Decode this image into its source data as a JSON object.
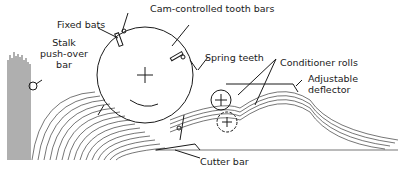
{
  "diagram": {
    "type": "mechanical-schematic",
    "labels": {
      "fixed_bats": "Fixed bats",
      "cam_controlled_tooth_bars": "Cam-controlled tooth bars",
      "stalk_pushover_line1": "Stalk",
      "stalk_pushover_line2": "push-over",
      "stalk_pushover_line3": "bar",
      "spring_teeth": "Spring teeth",
      "conditioner_rolls": "Conditioner rolls",
      "adjustable_line1": "Adjustable",
      "adjustable_line2": "deflector",
      "cutter_bar": "Cutter bar"
    },
    "colors": {
      "ink": "#1a1a1a",
      "background": "#ffffff"
    }
  }
}
